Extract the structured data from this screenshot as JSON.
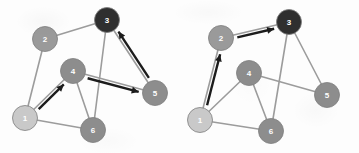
{
  "figure": {
    "type": "node-link-diagram",
    "panel_count": 2,
    "background_color": "#fdfdfd",
    "node_radius": 12.5,
    "node_stroke_color": "#7d7d7d",
    "edge_color": "#9c9c9c",
    "edge_width": 1.6,
    "arrow_color": "#1c1c1c",
    "arrow_width": 2.4,
    "label_color": "#ffffff"
  },
  "node_palette": {
    "lightest": "#c9c9c9",
    "light": "#b4b4b4",
    "medium": "#8d8d8d",
    "medium_dark": "#858585",
    "darkest": "#2f2f2f"
  },
  "panels": [
    {
      "id": "left",
      "name": "left-graph",
      "nodes": [
        {
          "id": "1",
          "label": "1",
          "cx": 25,
          "cy": 118,
          "fill": "#c9c9c9"
        },
        {
          "id": "2",
          "label": "2",
          "cx": 45,
          "cy": 39,
          "fill": "#9a9a9a"
        },
        {
          "id": "3",
          "label": "3",
          "cx": 107,
          "cy": 20,
          "fill": "#2f2f2f"
        },
        {
          "id": "4",
          "label": "4",
          "cx": 73,
          "cy": 71,
          "fill": "#8d8d8d"
        },
        {
          "id": "5",
          "label": "5",
          "cx": 155,
          "cy": 93,
          "fill": "#8d8d8d"
        },
        {
          "id": "6",
          "label": "6",
          "cx": 93,
          "cy": 130,
          "fill": "#8d8d8d"
        }
      ],
      "edges": [
        {
          "from": "1",
          "to": "2"
        },
        {
          "from": "2",
          "to": "3"
        },
        {
          "from": "1",
          "to": "4"
        },
        {
          "from": "1",
          "to": "6"
        },
        {
          "from": "4",
          "to": "6"
        },
        {
          "from": "4",
          "to": "5"
        },
        {
          "from": "3",
          "to": "5"
        },
        {
          "from": "3",
          "to": "6"
        }
      ],
      "arrows": [
        {
          "from": "5",
          "to": "3",
          "name": "arrow-5-to-3"
        },
        {
          "from": "4",
          "to": "5",
          "name": "arrow-4-to-5"
        },
        {
          "from": "1",
          "to": "4",
          "name": "arrow-1-to-4"
        }
      ]
    },
    {
      "id": "right",
      "name": "right-graph",
      "nodes": [
        {
          "id": "1",
          "label": "1",
          "cx": 21,
          "cy": 120,
          "fill": "#c9c9c9"
        },
        {
          "id": "2",
          "label": "2",
          "cx": 42,
          "cy": 38,
          "fill": "#9a9a9a"
        },
        {
          "id": "3",
          "label": "3",
          "cx": 110,
          "cy": 22,
          "fill": "#2f2f2f"
        },
        {
          "id": "4",
          "label": "4",
          "cx": 70,
          "cy": 73,
          "fill": "#8d8d8d"
        },
        {
          "id": "5",
          "label": "5",
          "cx": 148,
          "cy": 95,
          "fill": "#8d8d8d"
        },
        {
          "id": "6",
          "label": "6",
          "cx": 92,
          "cy": 131,
          "fill": "#8d8d8d"
        }
      ],
      "edges": [
        {
          "from": "1",
          "to": "2"
        },
        {
          "from": "2",
          "to": "3"
        },
        {
          "from": "1",
          "to": "4"
        },
        {
          "from": "1",
          "to": "6"
        },
        {
          "from": "4",
          "to": "6"
        },
        {
          "from": "4",
          "to": "5"
        },
        {
          "from": "3",
          "to": "5"
        },
        {
          "from": "3",
          "to": "6"
        }
      ],
      "arrows": [
        {
          "from": "2",
          "to": "3",
          "name": "arrow-2-to-3"
        },
        {
          "from": "1",
          "to": "2",
          "name": "arrow-1-to-2"
        }
      ]
    }
  ]
}
